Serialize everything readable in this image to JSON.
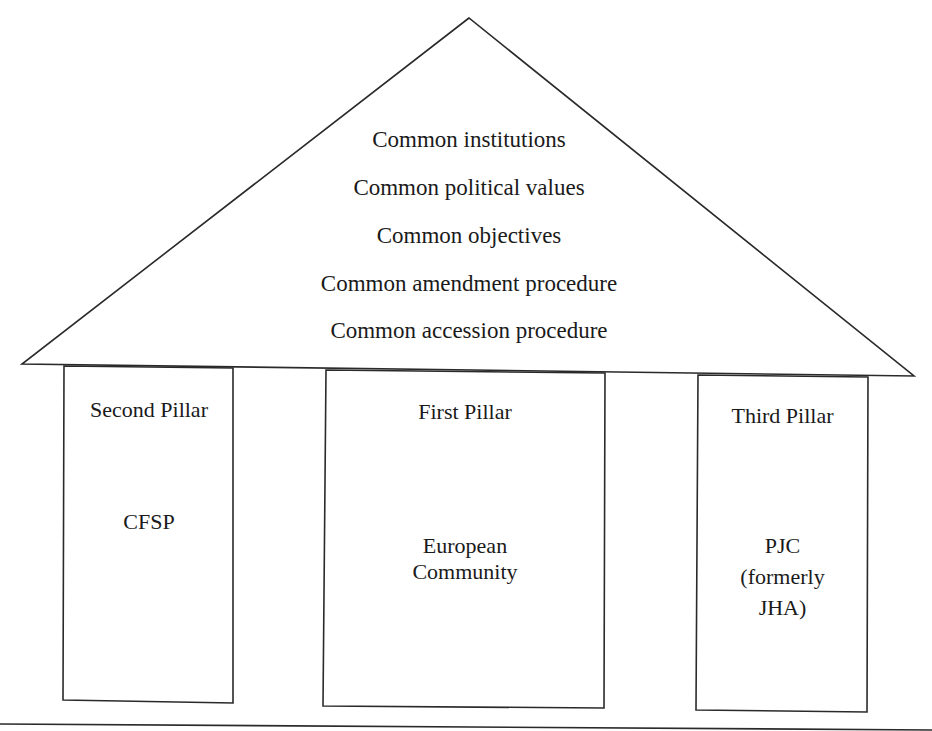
{
  "diagram": {
    "type": "temple-pillar-diagram",
    "roof": {
      "items": [
        "Common institutions",
        "Common political values",
        "Common objectives",
        "Common amendment procedure",
        "Common accession procedure"
      ]
    },
    "pillars": [
      {
        "title": "Second Pillar",
        "body": "CFSP"
      },
      {
        "title": "First Pillar",
        "body": "European Community"
      },
      {
        "title": "Third Pillar",
        "body": "PJC (formerly JHA)"
      }
    ],
    "pillar_body_lines": {
      "second": [
        "CFSP"
      ],
      "first": [
        "European",
        "Community"
      ],
      "third": [
        "PJC",
        "(formerly",
        "JHA)"
      ]
    },
    "colors": {
      "line": "#2a2a2a",
      "text": "#1a1a1a",
      "background": "#ffffff"
    }
  }
}
